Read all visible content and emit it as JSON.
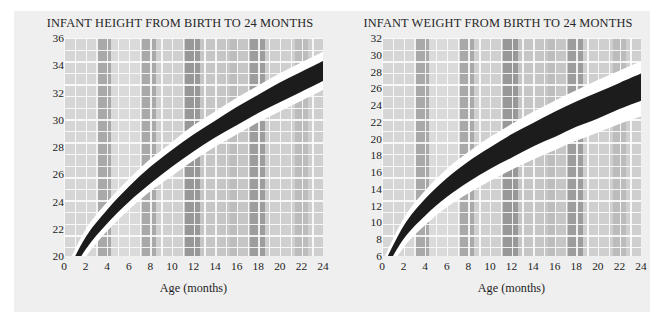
{
  "page": {
    "background": "#ffffff",
    "card_background": "#efefef"
  },
  "colors": {
    "band_black": "#1c1c1c",
    "band_white": "#ffffff",
    "grid_light": "#d9d9d9",
    "grid_mid": "#c9c9c9",
    "grid_dark": "#a8a8a8",
    "text": "#1e1e1e"
  },
  "charts": [
    {
      "id": "infant-height",
      "title": "INFANT HEIGHT FROM BIRTH TO 24 MONTHS",
      "xlabel": "Age (months)",
      "ylabel": "Height (inches)",
      "xticks": [
        "0",
        "2",
        "4",
        "6",
        "8",
        "10",
        "12",
        "14",
        "16",
        "18",
        "20",
        "22",
        "24"
      ],
      "yticks": [
        "20",
        "22",
        "24",
        "26",
        "28",
        "30",
        "32",
        "34",
        "36"
      ]
    },
    {
      "id": "infant-weight",
      "title": "INFANT WEIGHT FROM BIRTH TO 24 MONTHS",
      "xlabel": "Age (months)",
      "ylabel": "Weight (pounds)",
      "xticks": [
        "0",
        "2",
        "4",
        "6",
        "8",
        "10",
        "12",
        "14",
        "16",
        "18",
        "20",
        "22",
        "24"
      ],
      "yticks": [
        "6",
        "8",
        "10",
        "12",
        "14",
        "16",
        "18",
        "20",
        "22",
        "24",
        "26",
        "28",
        "30",
        "32"
      ]
    }
  ],
  "chart_data": [
    {
      "type": "area",
      "id": "infant-height",
      "title": "INFANT HEIGHT FROM BIRTH TO 24 MONTHS",
      "xlabel": "Age (months)",
      "ylabel": "Height (inches)",
      "xlim": [
        0,
        24
      ],
      "ylim": [
        19.4,
        36.3
      ],
      "grid": true,
      "legend": "none",
      "x": [
        0,
        2,
        4,
        6,
        8,
        10,
        12,
        14,
        16,
        18,
        20,
        22,
        24
      ],
      "series": [
        {
          "name": "upper bound (white edge)",
          "color": "#ffffff",
          "values": [
            21.0,
            23.8,
            25.6,
            27.1,
            28.4,
            29.5,
            30.6,
            31.5,
            32.4,
            33.2,
            34.0,
            34.7,
            35.4
          ]
        },
        {
          "name": "upper percentile (black band top)",
          "color": "#1c1c1c",
          "values": [
            20.6,
            23.3,
            25.1,
            26.6,
            27.9,
            29.0,
            30.0,
            30.9,
            31.8,
            32.6,
            33.4,
            34.1,
            34.8
          ]
        },
        {
          "name": "lower percentile (black band bottom)",
          "color": "#1c1c1c",
          "values": [
            20.1,
            22.5,
            24.2,
            25.6,
            26.8,
            27.9,
            28.9,
            29.8,
            30.6,
            31.4,
            32.1,
            32.8,
            33.5
          ]
        },
        {
          "name": "lower bound (white edge)",
          "color": "#ffffff",
          "values": [
            19.7,
            22.0,
            23.7,
            25.1,
            26.3,
            27.3,
            28.3,
            29.2,
            30.0,
            30.8,
            31.5,
            32.2,
            32.9
          ]
        }
      ]
    },
    {
      "type": "area",
      "id": "infant-weight",
      "title": "INFANT WEIGHT FROM BIRTH TO 24 MONTHS",
      "xlabel": "Age (months)",
      "ylabel": "Weight (pounds)",
      "xlim": [
        0,
        24
      ],
      "ylim": [
        4.9,
        32.6
      ],
      "grid": true,
      "legend": "none",
      "x": [
        0,
        2,
        4,
        6,
        8,
        10,
        12,
        14,
        16,
        18,
        20,
        22,
        24
      ],
      "series": [
        {
          "name": "upper bound (white edge)",
          "color": "#ffffff",
          "values": [
            8.6,
            13.3,
            16.3,
            18.6,
            20.4,
            22.0,
            23.4,
            24.7,
            25.9,
            27.0,
            28.1,
            29.1,
            30.1
          ]
        },
        {
          "name": "upper percentile (black band top)",
          "color": "#1c1c1c",
          "values": [
            8.0,
            12.5,
            15.4,
            17.6,
            19.4,
            20.9,
            22.3,
            23.5,
            24.7,
            25.8,
            26.8,
            27.8,
            28.8
          ]
        },
        {
          "name": "lower percentile (black band bottom)",
          "color": "#1c1c1c",
          "values": [
            7.2,
            11.1,
            13.6,
            15.6,
            17.2,
            18.6,
            19.8,
            21.0,
            22.0,
            23.1,
            24.0,
            25.0,
            25.9
          ]
        },
        {
          "name": "lower bound (white edge)",
          "color": "#ffffff",
          "values": [
            6.5,
            10.2,
            12.6,
            14.5,
            16.0,
            17.3,
            18.5,
            19.6,
            20.6,
            21.6,
            22.5,
            23.4,
            24.2
          ]
        }
      ]
    }
  ]
}
